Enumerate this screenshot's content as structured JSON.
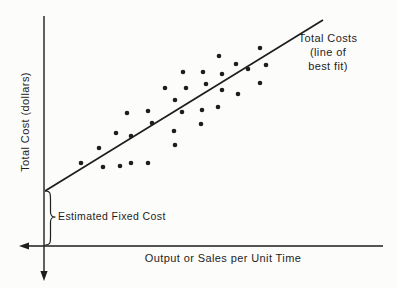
{
  "figure": {
    "background": "#fcfcfa",
    "ink": "#1e1e1e"
  },
  "chart_data": {
    "type": "scatter",
    "title": "",
    "xlabel": "Output or Sales per Unit Time",
    "ylabel": "Total Cost (dollars)",
    "grid": false,
    "axis_numeric_labels": false,
    "annotation_lines": [
      "Total Costs",
      "(line of",
      "best fit)"
    ],
    "fixed_cost_label": "Estimated Fixed Cost",
    "axes_px": {
      "y_axis_x": 44,
      "y_axis_top": 16,
      "y_axis_bottom": 272,
      "y_axis_arrow_tip": 281,
      "x_axis_y": 246,
      "x_axis_left": 28,
      "x_axis_right": 383,
      "x_axis_arrow_tip": 19
    },
    "fit_line_px": {
      "x1": 45,
      "y1": 191,
      "x2": 323,
      "y2": 20
    },
    "brace_px": {
      "body_x": 50.5,
      "top": 191,
      "bottom": 245,
      "mid": 217,
      "tip_x": 55.5,
      "attach_x": 45.5
    },
    "point_radius_px": 2.3,
    "points_px": [
      [
        219,
        56
      ],
      [
        260,
        48
      ],
      [
        236,
        64
      ],
      [
        266,
        65
      ],
      [
        248,
        69
      ],
      [
        203,
        72
      ],
      [
        222,
        74
      ],
      [
        183,
        72
      ],
      [
        165,
        88
      ],
      [
        186,
        88
      ],
      [
        206,
        84
      ],
      [
        260,
        83
      ],
      [
        222,
        90
      ],
      [
        238,
        94
      ],
      [
        175,
        100
      ],
      [
        182,
        112
      ],
      [
        202,
        110
      ],
      [
        218,
        107
      ],
      [
        201,
        124
      ],
      [
        148,
        111
      ],
      [
        127,
        113
      ],
      [
        116,
        133
      ],
      [
        131,
        136
      ],
      [
        152,
        123
      ],
      [
        174,
        131
      ],
      [
        175,
        145
      ],
      [
        99,
        148
      ],
      [
        81,
        163
      ],
      [
        103,
        167
      ],
      [
        120,
        166
      ],
      [
        131,
        163
      ],
      [
        148,
        163
      ]
    ]
  }
}
